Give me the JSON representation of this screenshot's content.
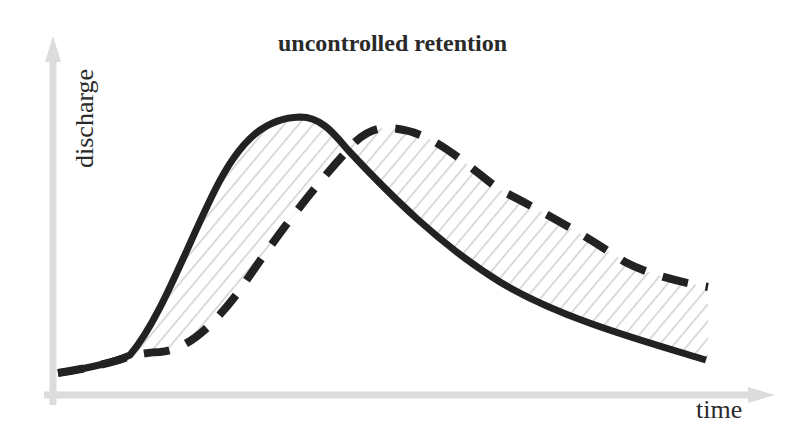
{
  "diagram": {
    "title": "uncontrolled retention",
    "y_axis_label": "discharge",
    "x_axis_label": "time",
    "colors": {
      "axis": "#dcdcdc",
      "curve": "#222222",
      "hatch": "#cfcfcf",
      "text": "#2a2a2a",
      "background": "#ffffff"
    },
    "curves": [
      {
        "name": "inflow hydrograph",
        "style": "solid"
      },
      {
        "name": "outflow hydrograph (retained)",
        "style": "dashed"
      }
    ],
    "shaded_region": "area between inflow and outflow hydrographs (hatched)"
  }
}
